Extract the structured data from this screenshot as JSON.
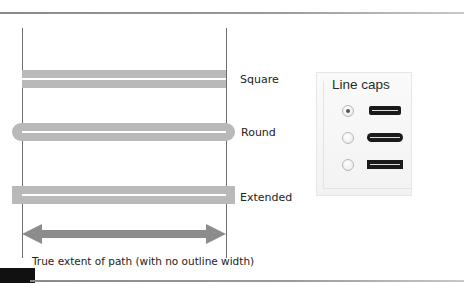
{
  "diagram": {
    "strokes": [
      {
        "id": "square",
        "label": "Square"
      },
      {
        "id": "round",
        "label": "Round"
      },
      {
        "id": "extended",
        "label": "Extended"
      }
    ],
    "caption": "True extent of path (with no outline width)"
  },
  "panel": {
    "title": "Line caps",
    "options": [
      {
        "id": "butt-cap",
        "checked": true
      },
      {
        "id": "round-cap",
        "checked": false
      },
      {
        "id": "projecting-cap",
        "checked": false
      }
    ]
  },
  "colors": {
    "stroke_fill": "#b9b9b9",
    "arrow_fill": "#8c8c8c",
    "guide_line": "#6f6f6f"
  }
}
